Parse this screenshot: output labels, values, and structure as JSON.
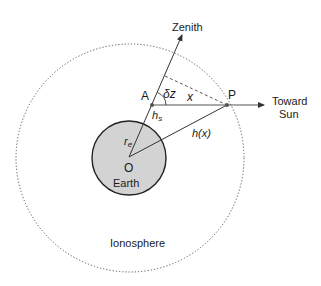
{
  "labels": {
    "zenith": "Zenith",
    "toward": "Toward",
    "sun": "Sun",
    "point_a": "A",
    "point_p": "P",
    "point_o": "O",
    "earth": "Earth",
    "ionosphere": "Ionosphere",
    "delta_z": "δz",
    "x": "x",
    "h_s_base": "h",
    "h_s_sub": "s",
    "r_e_base": "r",
    "r_e_sub": "e",
    "h_x": "h(x)"
  },
  "colors": {
    "earth_fill": "#d3d3d3",
    "stroke": "#333333",
    "dotted": "#555555"
  }
}
